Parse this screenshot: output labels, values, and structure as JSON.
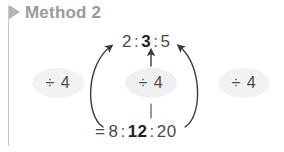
{
  "header": {
    "title": "Method 2",
    "icon": "play-triangle-icon",
    "color": "#9a9a9a"
  },
  "diagram": {
    "top_ratio": {
      "parts": [
        "2",
        "3",
        "5"
      ],
      "bold_index": 1,
      "separator": ":",
      "prefix": "",
      "text": "2 : 3 : 5"
    },
    "bottom_ratio": {
      "parts": [
        "8",
        "12",
        "20"
      ],
      "bold_index": 1,
      "separator": ":",
      "prefix": "=",
      "text": "= 8 : 12 : 20"
    },
    "operations": [
      {
        "label": "÷ 4",
        "position": "left"
      },
      {
        "label": "÷ 4",
        "position": "center"
      },
      {
        "label": "÷ 4",
        "position": "right"
      }
    ],
    "arrows": [
      {
        "name": "left-curved-arrow",
        "from": "bottom-ratio",
        "to": "top-ratio",
        "style": "solid-curve"
      },
      {
        "name": "center-vertical-arrow",
        "from": "bottom-ratio",
        "to": "top-ratio",
        "style": "dashed-straight"
      },
      {
        "name": "right-curved-arrow",
        "from": "bottom-ratio",
        "to": "top-ratio",
        "style": "solid-curve"
      }
    ],
    "colors": {
      "pill_fill": "#f2f2f2",
      "text": "#4a4a4a",
      "bold_text": "#1f1f1f",
      "arrow": "#3a3a3a",
      "flag": "#b3b3b3"
    }
  }
}
